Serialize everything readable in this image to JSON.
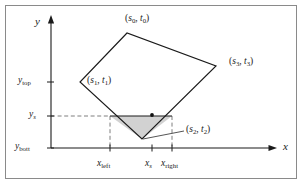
{
  "figure": {
    "title": "",
    "background_color": "#ffffff",
    "border_color": "#8a8a8a",
    "line_color": "#1a1a1a",
    "shade_color": "#d0d0d0",
    "dashed_color": "#7a7a7a"
  },
  "axes": {
    "x_label": "x",
    "y_label": "y",
    "x_ticks": [
      {
        "name": "x-left",
        "label_main": "x",
        "label_sub": "left",
        "px": 110
      },
      {
        "name": "x-s",
        "label_main": "x",
        "label_sub": "s",
        "px": 152
      },
      {
        "name": "x-right",
        "label_main": "x",
        "label_sub": "right",
        "px": 172
      }
    ],
    "y_ticks": [
      {
        "name": "y-top",
        "label_main": "y",
        "label_sub": "top",
        "px": 82
      },
      {
        "name": "y-s",
        "label_main": "y",
        "label_sub": "s",
        "px": 116
      },
      {
        "name": "y-bott",
        "label_main": "y",
        "label_sub": "bott",
        "px": 148
      }
    ]
  },
  "polygon": {
    "name": "quadrilateral",
    "vertices": [
      {
        "id": "s0",
        "label_main": "(s",
        "label_sub0": "0",
        "label_mid": ", t",
        "label_sub1": "0",
        "label_end": ")",
        "x": 127,
        "y": 33
      },
      {
        "id": "s1",
        "label_main": "(s",
        "label_sub0": "1",
        "label_mid": ", t",
        "label_sub1": "1",
        "label_end": ")",
        "x": 80,
        "y": 82
      },
      {
        "id": "s2",
        "label_main": "(s",
        "label_sub0": "2",
        "label_mid": ", t",
        "label_sub1": "2",
        "label_end": ")",
        "x": 142,
        "y": 139
      },
      {
        "id": "s3",
        "label_main": "(s",
        "label_sub0": "3",
        "label_mid": ", t",
        "label_sub1": "3",
        "label_end": ")",
        "x": 216,
        "y": 66
      }
    ]
  },
  "scanline": {
    "name": "scanline-span",
    "y_px": 116,
    "x_start_px": 110,
    "x_end_px": 172,
    "sample_point_px": {
      "x": 152,
      "y": 115
    }
  },
  "shaded_region": {
    "name": "shaded-triangle",
    "points_px": [
      [
        110,
        116
      ],
      [
        172,
        116
      ],
      [
        142,
        139
      ]
    ]
  },
  "vertex_labels": {
    "s0": {
      "text": "(s0, t0)",
      "left": 154,
      "top": 15
    },
    "s1": {
      "text": "(s1, t1)",
      "left": 86,
      "top": 75
    },
    "s2": {
      "text": "(s2, t2)",
      "left": 186,
      "top": 126
    },
    "s3": {
      "text": "(s3, t3)",
      "left": 231,
      "top": 58
    }
  }
}
